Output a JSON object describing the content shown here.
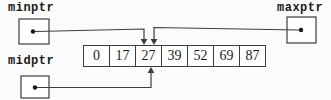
{
  "diagram": {
    "pointers": [
      {
        "id": "minptr",
        "label": "minptr",
        "points_to_value": "27",
        "arrow_direction": "down-into-top-of-cell"
      },
      {
        "id": "maxptr",
        "label": "maxptr",
        "points_to_value": "27",
        "arrow_direction": "down-into-top-of-cell"
      },
      {
        "id": "midptr",
        "label": "midptr",
        "points_to_value": "27",
        "arrow_direction": "up-into-bottom-of-cell"
      }
    ],
    "array": {
      "values": [
        "0",
        "17",
        "27",
        "39",
        "52",
        "69",
        "87"
      ],
      "cell_count": 7,
      "pointed_value": "27"
    },
    "icons": [
      {
        "name": "pointer-dot-icon",
        "glyph": "●"
      },
      {
        "name": "arrow-down-icon",
        "glyph": "▼"
      },
      {
        "name": "arrow-up-icon",
        "glyph": "▲"
      }
    ],
    "colors": {
      "line": "#3d3d3d",
      "text": "#1a1a1a",
      "background": "#fbfbfb"
    }
  }
}
